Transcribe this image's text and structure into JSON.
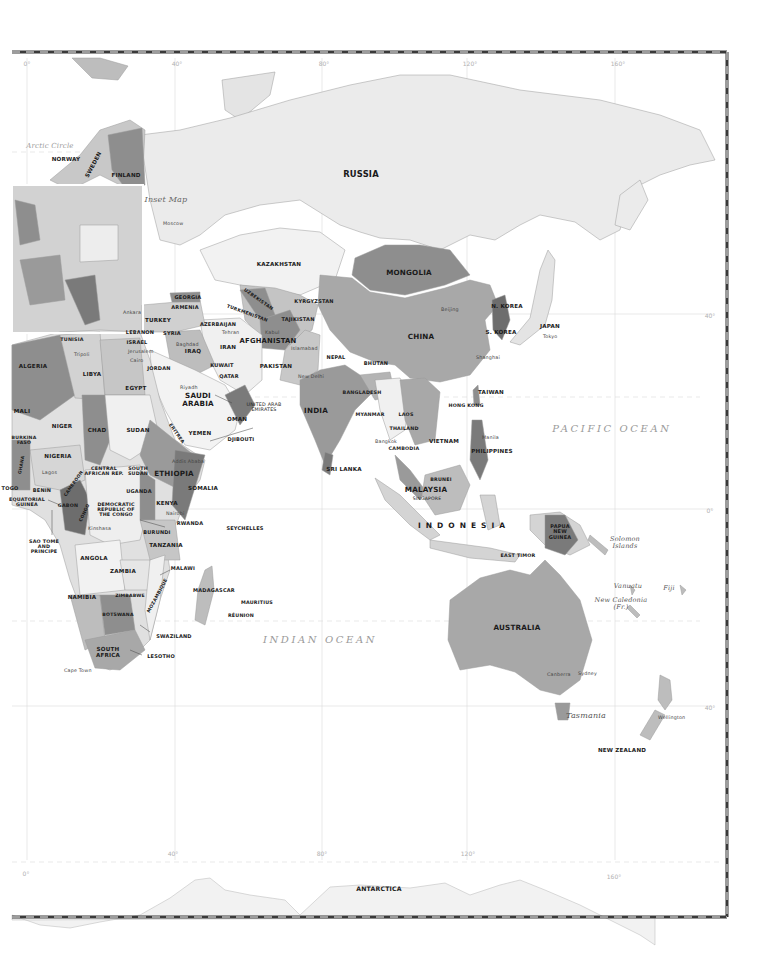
{
  "map": {
    "title": "Eastern Hemisphere political map",
    "inset_label": "Inset Map",
    "arctic_circle_label": "Arctic Circle",
    "colors": {
      "land_light": "#e9e9e9",
      "land_mid": "#bdbdbd",
      "land_dark": "#8e8e8e",
      "land_darkest": "#6d6d6d",
      "border": "#3a3a3a",
      "grid": "#d6d6d6",
      "label": "#1a1a1a",
      "ocean_label": "#9a9a9a"
    },
    "longitude_ticks_top": [
      "0°",
      "40°",
      "80°",
      "120°",
      "160°"
    ],
    "longitude_ticks_bottom": [
      "0°",
      "40°",
      "80°",
      "120°",
      "160°"
    ],
    "latitude_ticks_right": [
      "40°",
      "0°",
      "40°"
    ],
    "oceans": [
      "PACIFIC OCEAN",
      "INDIAN OCEAN"
    ],
    "countries": {
      "russia": "RUSSIA",
      "norway": "NORWAY",
      "sweden": "SWEDEN",
      "finland": "FINLAND",
      "kazakhstan": "KAZAKHSTAN",
      "mongolia": "MONGOLIA",
      "china": "CHINA",
      "n_korea": "N. KOREA",
      "s_korea": "S. KOREA",
      "japan": "JAPAN",
      "taiwan": "TAIWAN",
      "hong_kong": "HONG KONG",
      "georgia": "GEORGIA",
      "armenia": "ARMENIA",
      "azerbaijan": "AZERBAIJAN",
      "turkey": "TURKEY",
      "uzbekistan": "UZBEKISTAN",
      "turkmenistan": "TURKMENISTAN",
      "kyrgyzstan": "KYRGYZSTAN",
      "tajikistan": "TAJIKISTAN",
      "afghanistan": "AFGHANISTAN",
      "pakistan": "PAKISTAN",
      "iran": "IRAN",
      "iraq": "IRAQ",
      "syria": "SYRIA",
      "lebanon": "LEBANON",
      "israel": "ISRAEL",
      "jordan": "JORDAN",
      "kuwait": "KUWAIT",
      "qatar": "QATAR",
      "saudi_arabia": "SAUDI ARABIA",
      "uae": "UNITED ARAB EMIRATES",
      "oman": "OMAN",
      "yemen": "YEMEN",
      "nepal": "NEPAL",
      "bhutan": "BHUTAN",
      "india": "INDIA",
      "bangladesh": "BANGLADESH",
      "myanmar": "MYANMAR",
      "laos": "LAOS",
      "thailand": "THAILAND",
      "cambodia": "CAMBODIA",
      "vietnam": "VIETNAM",
      "philippines": "PHILIPPINES",
      "sri_lanka": "SRI LANKA",
      "brunei": "BRUNEI",
      "malaysia": "MALAYSIA",
      "singapore": "SINGAPORE",
      "indonesia": "INDONESIA",
      "papua_new_guinea": "PAPUA NEW GUINEA",
      "east_timor": "EAST TIMOR",
      "australia": "AUSTRALIA",
      "new_zealand": "NEW ZEALAND",
      "tunisia": "TUNISIA",
      "algeria": "ALGERIA",
      "libya": "LIBYA",
      "egypt": "EGYPT",
      "mali": "MALI",
      "niger": "NIGER",
      "chad": "CHAD",
      "sudan": "SUDAN",
      "eritrea": "ERITREA",
      "djibouti": "DJIBOUTI",
      "burkina_faso": "BURKINA FASO",
      "nigeria": "NIGERIA",
      "ghana": "GHANA",
      "togo": "TOGO",
      "benin": "BENIN",
      "cameroon": "CAMEROON",
      "central_african_rep": "CENTRAL AFRICAN REP.",
      "south_sudan": "SOUTH SUDAN",
      "ethiopia": "ETHIOPIA",
      "somalia": "SOMALIA",
      "equatorial_guinea": "EQUATORIAL GUINEA",
      "gabon": "GABON",
      "congo": "CONGO",
      "drc": "DEMOCRATIC REPUBLIC OF THE CONGO",
      "uganda": "UGANDA",
      "kenya": "KENYA",
      "rwanda": "RWANDA",
      "burundi": "BURUNDI",
      "tanzania": "TANZANIA",
      "seychelles": "SEYCHELLES",
      "sao_tome": "SAO TOME AND PRINCIPE",
      "angola": "ANGOLA",
      "zambia": "ZAMBIA",
      "malawi": "MALAWI",
      "mozambique": "MOZAMBIQUE",
      "zimbabwe": "ZIMBABWE",
      "namibia": "NAMIBIA",
      "botswana": "BOTSWANA",
      "madagascar": "MADAGASCAR",
      "mauritius": "MAURITIUS",
      "reunion": "RÉUNION",
      "swaziland": "SWAZILAND",
      "south_africa": "SOUTH AFRICA",
      "lesotho": "LESOTHO",
      "antarctica": "ANTARCTICA"
    },
    "islands_italic": {
      "solomon": "Solomon Islands",
      "vanuatu": "Vanuatu",
      "fiji": "Fiji",
      "new_caledonia": "New Caledonia (Fr.)",
      "tasmania": "Tasmania"
    },
    "cities": {
      "moscow": "Moscow",
      "ankara": "Ankara",
      "tehran": "Tehran",
      "baghdad": "Baghdad",
      "jerusalem": "Jerusalem",
      "cairo": "Cairo",
      "tripoli": "Tripoli",
      "riyadh": "Riyadh",
      "kabul": "Kabul",
      "islamabad": "Islamabad",
      "new_delhi": "New Delhi",
      "beijing": "Beijing",
      "shanghai": "Shanghai",
      "tokyo": "Tokyo",
      "bangkok": "Bangkok",
      "manila": "Manila",
      "addis_ababa": "Addis Ababa",
      "nairobi": "Nairobi",
      "lagos": "Lagos",
      "kinshasa": "Kinshasa",
      "cape_town": "Cape Town",
      "canberra": "Canberra",
      "sydney": "Sydney",
      "wellington": "Wellington"
    }
  }
}
